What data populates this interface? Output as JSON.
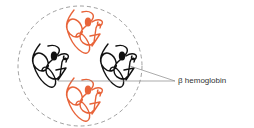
{
  "diagram": {
    "label": "β hemoglobin",
    "colors": {
      "alpha_chain": "#e8643a",
      "beta_chain": "#111111",
      "boundary": "#888888",
      "leader": "#888888"
    },
    "subunits": [
      {
        "name": "alpha-top",
        "color": "orange"
      },
      {
        "name": "beta-left",
        "color": "black"
      },
      {
        "name": "beta-right",
        "color": "black"
      },
      {
        "name": "alpha-bottom",
        "color": "orange"
      }
    ]
  }
}
